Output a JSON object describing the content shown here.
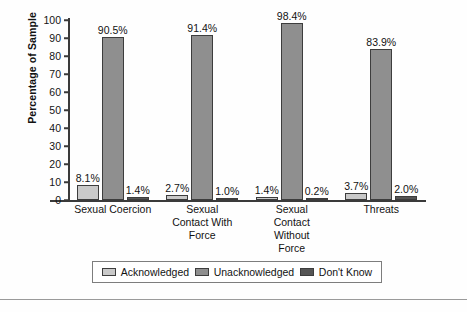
{
  "chart_data": {
    "type": "bar",
    "title": "",
    "xlabel": "",
    "ylabel": "Percentage of Sample",
    "ylim": [
      0,
      100
    ],
    "ytick_labels": [
      "100",
      "90",
      "80",
      "70",
      "60",
      "50",
      "40",
      "30",
      "20",
      "10",
      "0"
    ],
    "ytick_values": [
      100,
      90,
      80,
      70,
      60,
      50,
      40,
      30,
      20,
      10,
      0
    ],
    "grid": false,
    "legend_position": "bottom",
    "categories": [
      "Sexual Coercion",
      "Sexual Contact With Force",
      "Sexual Contact Without Force",
      "Threats"
    ],
    "category_lines": [
      [
        "Sexual Coercion"
      ],
      [
        "Sexual",
        "Contact With",
        "Force"
      ],
      [
        "Sexual",
        "Contact",
        "Without",
        "Force"
      ],
      [
        "Threats"
      ]
    ],
    "series": [
      {
        "name": "Acknowledged",
        "color": "#c9c9c9",
        "values": [
          8.1,
          2.7,
          1.4,
          3.7
        ],
        "labels": [
          "8.1%",
          "2.7%",
          "1.4%",
          "3.7%"
        ]
      },
      {
        "name": "Unacknowledged",
        "color": "#8f8f8f",
        "values": [
          90.5,
          91.4,
          98.4,
          83.9
        ],
        "labels": [
          "90.5%",
          "91.4%",
          "98.4%",
          "83.9%"
        ]
      },
      {
        "name": "Don't Know",
        "color": "#555555",
        "values": [
          1.4,
          1.0,
          0.2,
          2.0
        ],
        "labels": [
          "1.4%",
          "1.0%",
          "0.2%",
          "2.0%"
        ]
      }
    ]
  },
  "legend": {
    "items": [
      {
        "label": "Acknowledged",
        "swatch": "ack"
      },
      {
        "label": "Unacknowledged",
        "swatch": "unack"
      },
      {
        "label": "Don't Know",
        "swatch": "dk"
      }
    ]
  }
}
